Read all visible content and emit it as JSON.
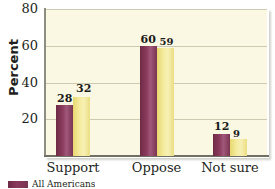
{
  "chart_data": {
    "type": "bar",
    "title": "",
    "xlabel": "",
    "ylabel": "Percent",
    "ylim": [
      0,
      80
    ],
    "yticks": [
      20,
      40,
      60,
      80
    ],
    "grid": true,
    "legend_position": "bottom-left",
    "categories": [
      "Support",
      "Oppose",
      "Not sure"
    ],
    "series": [
      {
        "name": "All Americans",
        "color": "#7b3352",
        "values": [
          28,
          60,
          12
        ]
      },
      {
        "name": "",
        "color": "#f0e185",
        "values": [
          32,
          59,
          9
        ]
      }
    ]
  },
  "axis": {
    "y_title": "Percent",
    "ticks": [
      {
        "label": "80",
        "value": 80
      },
      {
        "label": "60",
        "value": 60
      },
      {
        "label": "40",
        "value": 40
      },
      {
        "label": "20",
        "value": 20
      }
    ]
  },
  "groups": [
    {
      "category": "Support",
      "bars": [
        {
          "value": 28,
          "label": "28",
          "series": "All Americans"
        },
        {
          "value": 32,
          "label": "32",
          "series": ""
        }
      ]
    },
    {
      "category": "Oppose",
      "bars": [
        {
          "value": 60,
          "label": "60",
          "series": "All Americans"
        },
        {
          "value": 59,
          "label": "59",
          "series": ""
        }
      ]
    },
    {
      "category": "Not sure",
      "bars": [
        {
          "value": 12,
          "label": "12",
          "series": "All Americans"
        },
        {
          "value": 9,
          "label": "9",
          "series": ""
        }
      ]
    }
  ],
  "legend": {
    "items": [
      {
        "label": "All Americans",
        "color": "#7b3352"
      }
    ]
  },
  "colors": {
    "series_1": "#7b3352",
    "series_2": "#f0e185",
    "plot_background": "#faf8e2",
    "gridline": "#cfcbb0",
    "text": "#231f20"
  }
}
